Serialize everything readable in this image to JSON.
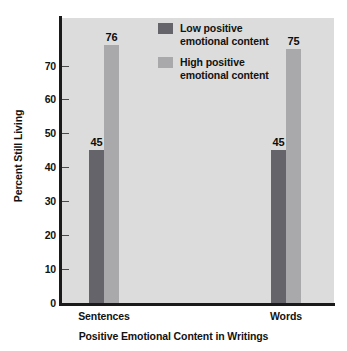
{
  "chart_data": {
    "type": "bar",
    "title": "",
    "xlabel": "Positive Emotional Content in Writings",
    "ylabel": "Percent Still Living",
    "categories": [
      "Sentences",
      "Words"
    ],
    "series": [
      {
        "name": "Low positive emotional content",
        "values": [
          45,
          45
        ],
        "color": "#64646a"
      },
      {
        "name": "High positive emotional content",
        "values": [
          76,
          75
        ],
        "color": "#a9a9ab"
      }
    ],
    "ylim": [
      0,
      84
    ],
    "yticks": [
      0,
      10,
      20,
      30,
      40,
      50,
      60,
      70
    ],
    "grid": false,
    "legend_position": "inside-top-center",
    "plot_background": "#dcdcdc",
    "axis_color": "#1a1a1a"
  },
  "legend": {
    "items": [
      {
        "label": "Low positive\nemotional content",
        "swatch_name": "legend-swatch-low"
      },
      {
        "label": "High positive\nemotional content",
        "swatch_name": "legend-swatch-high"
      }
    ]
  }
}
